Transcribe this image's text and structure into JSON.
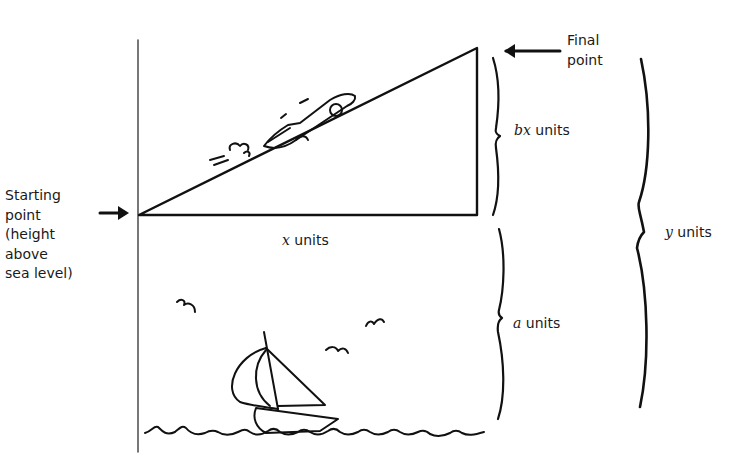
{
  "diagram": {
    "type": "height-above-sea-level illustration",
    "labels": {
      "starting_point": "Starting\npoint\n(height\nabove\nsea level)",
      "final_point": "Final\npoint",
      "bx": {
        "var": "bx",
        "suffix": " units"
      },
      "x": {
        "var": "x",
        "suffix": " units"
      },
      "a": {
        "var": "a",
        "suffix": " units"
      },
      "y": {
        "var": "y",
        "suffix": " units"
      }
    },
    "geometry": {
      "triangle": {
        "start": [
          138,
          215
        ],
        "right": [
          477,
          215
        ],
        "top": [
          477,
          48
        ]
      },
      "vertical_axis": {
        "x": 138,
        "y1": 40,
        "y2": 452
      }
    },
    "icons": [
      "arrow-right-icon",
      "arrow-left-icon",
      "car-icon",
      "sailboat-icon",
      "bird-icon",
      "wave-icon",
      "brace-icon"
    ],
    "colors": {
      "ink": "#111111",
      "background": "#ffffff"
    }
  }
}
